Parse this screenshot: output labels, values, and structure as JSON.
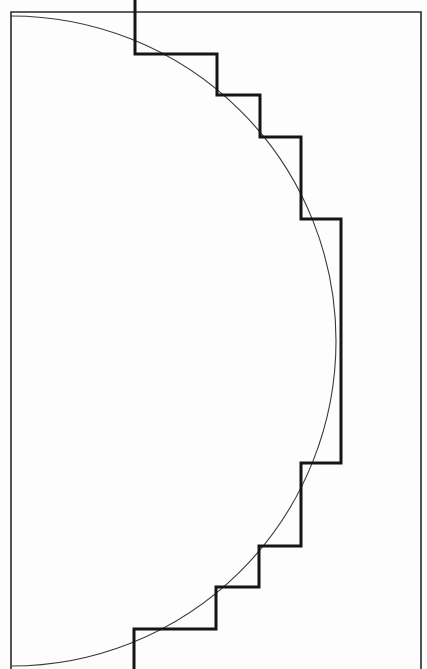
{
  "figure": {
    "canvas": {
      "width": 427,
      "height": 669,
      "background": "#fdfdfd"
    },
    "colors": {
      "frame": "#2a2a2a",
      "arc": "#3a3a3a",
      "staircase": "#151515"
    },
    "frame": {
      "left_x": 11,
      "top_y": 12,
      "right_x": 421,
      "bottom_y": 669,
      "stroke_width": 1.6
    },
    "arc": {
      "center_x": 11,
      "center_y": 341,
      "radius": 325,
      "stroke_width": 1.1
    },
    "staircase": {
      "stroke_width": 3,
      "points": [
        [
          135,
          0
        ],
        [
          135,
          54
        ],
        [
          217,
          54
        ],
        [
          217,
          95
        ],
        [
          260,
          95
        ],
        [
          260,
          137
        ],
        [
          301,
          137
        ],
        [
          301,
          219
        ],
        [
          341,
          219
        ],
        [
          341,
          463
        ],
        [
          301,
          463
        ],
        [
          301,
          546
        ],
        [
          259,
          546
        ],
        [
          259,
          587
        ],
        [
          216,
          587
        ],
        [
          216,
          629
        ],
        [
          134,
          629
        ],
        [
          134,
          669
        ]
      ]
    }
  }
}
